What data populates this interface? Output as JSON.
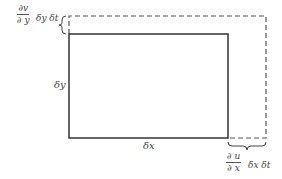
{
  "diagram": {
    "type": "fluid-element-deformation",
    "rectangle": {
      "height_label": "δy",
      "width_label": "δx"
    },
    "top_annotation": {
      "numerator": "∂v",
      "denominator": "∂ y",
      "suffix": "δy δt"
    },
    "right_annotation": {
      "numerator": "∂ u",
      "denominator": "∂ x",
      "suffix": "δx  δt"
    },
    "colors": {
      "solid_line": "#333333",
      "dashed_line": "#555555"
    }
  }
}
